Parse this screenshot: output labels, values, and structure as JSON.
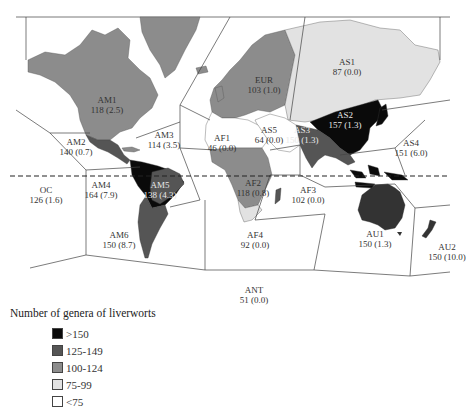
{
  "map": {
    "title": "Number of genera of liverworts",
    "colors": {
      "gt150": "#0a0a0a",
      "125_149": "#555555",
      "100_124": "#8c8c8c",
      "75_99": "#e2e2e2",
      "lt75": "#ffffff",
      "border": "#444444",
      "equator": "#222222"
    },
    "regions": [
      {
        "code": "AM1",
        "value": "118 (2.5)"
      },
      {
        "code": "AM2",
        "value": "140 (0.7)"
      },
      {
        "code": "AM3",
        "value": "114 (3.5)"
      },
      {
        "code": "AM4",
        "value": "164 (7.9)"
      },
      {
        "code": "AM5",
        "value": "138 (4.3)"
      },
      {
        "code": "AM6",
        "value": "150 (8.7)"
      },
      {
        "code": "OC",
        "value": "126 (1.6)"
      },
      {
        "code": "EUR",
        "value": "103 (1.0)"
      },
      {
        "code": "AF1",
        "value": "46 (0.0)"
      },
      {
        "code": "AF2",
        "value": "118 (0.8)"
      },
      {
        "code": "AF3",
        "value": "102 (0.0)"
      },
      {
        "code": "AF4",
        "value": "92 (0.0)"
      },
      {
        "code": "AS1",
        "value": "87 (0.0)"
      },
      {
        "code": "AS2",
        "value": "157 (1.3)"
      },
      {
        "code": "AS3",
        "value": "150 (1.3)"
      },
      {
        "code": "AS4",
        "value": "151 (6.0)"
      },
      {
        "code": "AS5",
        "value": "64 (0.0)"
      },
      {
        "code": "AU1",
        "value": "150 (1.3)"
      },
      {
        "code": "AU2",
        "value": "150 (10.0)"
      },
      {
        "code": "ANT",
        "value": "51 (0.0)"
      }
    ]
  },
  "legend": {
    "title": "Number of genera of liverworts",
    "items": [
      {
        "label": ">150",
        "color": "#0a0a0a"
      },
      {
        "label": "125-149",
        "color": "#555555"
      },
      {
        "label": "100-124",
        "color": "#8c8c8c"
      },
      {
        "label": "75-99",
        "color": "#e2e2e2"
      },
      {
        "label": "<75",
        "color": "#ffffff"
      }
    ]
  }
}
